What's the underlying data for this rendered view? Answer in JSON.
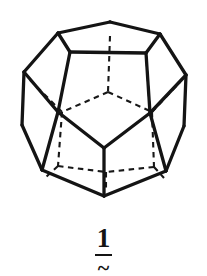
{
  "figure": {
    "shape_name": "dodecahedron",
    "style": "hand-drawn line illustration",
    "background_color": "#ffffff",
    "visible_edge_color": "#141414",
    "hidden_edge_color": "#181818",
    "hidden_edge_style": "dashed",
    "view": "front-facing pentagon, perspective from slightly above",
    "faces_total": 12,
    "vertices_total": 20,
    "edges_total": 30,
    "visible_edges": [
      {
        "name": "top-face-left-back",
        "x1": 110,
        "y1": 22,
        "x2": 58,
        "y2": 33
      },
      {
        "name": "top-face-right-back",
        "x1": 110,
        "y1": 22,
        "x2": 160,
        "y2": 34
      },
      {
        "name": "top-face-left-front",
        "x1": 58,
        "y1": 33,
        "x2": 70,
        "y2": 52
      },
      {
        "name": "top-face-right-front",
        "x1": 160,
        "y1": 34,
        "x2": 146,
        "y2": 53
      },
      {
        "name": "top-face-front",
        "x1": 70,
        "y1": 52,
        "x2": 146,
        "y2": 53
      },
      {
        "name": "upper-left-rib",
        "x1": 58,
        "y1": 33,
        "x2": 24,
        "y2": 72
      },
      {
        "name": "upper-right-rib",
        "x1": 160,
        "y1": 34,
        "x2": 186,
        "y2": 75
      },
      {
        "name": "left-upper-silhouette",
        "x1": 24,
        "y1": 72,
        "x2": 22,
        "y2": 125
      },
      {
        "name": "right-upper-silhouette",
        "x1": 186,
        "y1": 75,
        "x2": 184,
        "y2": 126
      },
      {
        "name": "left-mid-strut",
        "x1": 24,
        "y1": 72,
        "x2": 58,
        "y2": 112
      },
      {
        "name": "right-mid-strut",
        "x1": 186,
        "y1": 75,
        "x2": 150,
        "y2": 113
      },
      {
        "name": "front-face-upper-left",
        "x1": 70,
        "y1": 52,
        "x2": 58,
        "y2": 112
      },
      {
        "name": "front-face-upper-right",
        "x1": 146,
        "y1": 53,
        "x2": 150,
        "y2": 113
      },
      {
        "name": "front-face-lower-left",
        "x1": 58,
        "y1": 112,
        "x2": 104,
        "y2": 148
      },
      {
        "name": "front-face-lower-right",
        "x1": 150,
        "y1": 113,
        "x2": 104,
        "y2": 148
      },
      {
        "name": "left-lower-strut",
        "x1": 58,
        "y1": 112,
        "x2": 42,
        "y2": 170
      },
      {
        "name": "right-lower-strut",
        "x1": 150,
        "y1": 113,
        "x2": 166,
        "y2": 171
      },
      {
        "name": "left-lower-silhouette",
        "x1": 22,
        "y1": 125,
        "x2": 42,
        "y2": 170
      },
      {
        "name": "right-lower-silhouette",
        "x1": 184,
        "y1": 126,
        "x2": 166,
        "y2": 171
      },
      {
        "name": "front-bottom-center-strut",
        "x1": 104,
        "y1": 148,
        "x2": 104,
        "y2": 196
      },
      {
        "name": "bottom-face-left",
        "x1": 42,
        "y1": 170,
        "x2": 104,
        "y2": 196
      },
      {
        "name": "bottom-face-right",
        "x1": 166,
        "y1": 171,
        "x2": 104,
        "y2": 196
      }
    ],
    "hidden_edges": [
      {
        "name": "back-top-spoke",
        "x1": 110,
        "y1": 36,
        "x2": 108,
        "y2": 92
      },
      {
        "name": "back-upper-left-spoke",
        "x1": 108,
        "y1": 92,
        "x2": 62,
        "y2": 112
      },
      {
        "name": "back-upper-right-spoke",
        "x1": 108,
        "y1": 92,
        "x2": 152,
        "y2": 112
      },
      {
        "name": "back-left-rib-upper",
        "x1": 62,
        "y1": 112,
        "x2": 30,
        "y2": 80
      },
      {
        "name": "back-right-rib-upper",
        "x1": 152,
        "y1": 112,
        "x2": 180,
        "y2": 82
      },
      {
        "name": "back-left-vertical",
        "x1": 62,
        "y1": 112,
        "x2": 58,
        "y2": 166
      },
      {
        "name": "back-right-vertical",
        "x1": 152,
        "y1": 112,
        "x2": 154,
        "y2": 167
      },
      {
        "name": "back-bottom-left-spoke",
        "x1": 58,
        "y1": 166,
        "x2": 106,
        "y2": 172
      },
      {
        "name": "back-bottom-right-spoke",
        "x1": 154,
        "y1": 167,
        "x2": 106,
        "y2": 172
      },
      {
        "name": "back-bottom-center-spoke",
        "x1": 106,
        "y1": 172,
        "x2": 106,
        "y2": 190
      },
      {
        "name": "back-left-lower-tick",
        "x1": 58,
        "y1": 166,
        "x2": 46,
        "y2": 177
      },
      {
        "name": "back-right-lower-tick",
        "x1": 154,
        "y1": 167,
        "x2": 164,
        "y2": 178
      }
    ]
  },
  "label": {
    "number": "1",
    "tilde": "~",
    "underlined": true,
    "meaning": "compound-number-one"
  }
}
